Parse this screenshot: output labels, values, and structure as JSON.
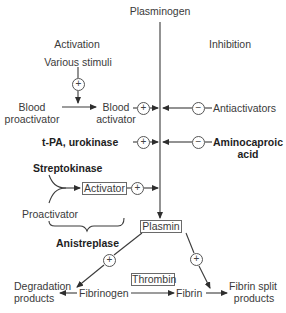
{
  "diagram": {
    "title_top": "Plasminogen",
    "section_headers": {
      "left": "Activation",
      "right": "Inhibition"
    },
    "activation": {
      "various_stimuli": "Various stimuli",
      "blood_proactivator_line1": "Blood",
      "blood_proactivator_line2": "proactivator",
      "blood_activator_line1": "Blood",
      "blood_activator_line2": "activator",
      "tpa_urokinase": "t-PA, urokinase",
      "streptokinase": "Streptokinase",
      "activator_box": "Activator",
      "proactivator": "Proactivator",
      "anistreplase": "Anistreplase"
    },
    "inhibition": {
      "antiactivators": "Antiactivators",
      "aminocaproic_line1": "Aminocaproic",
      "aminocaproic_line2": "acid"
    },
    "central": {
      "plasmin_box": "Plasmin",
      "thrombin_box": "Thrombin"
    },
    "products": {
      "degradation_line1": "Degradation",
      "degradation_line2": "products",
      "fibrinogen": "Fibrinogen",
      "fibrin": "Fibrin",
      "fibrin_split_line1": "Fibrin split",
      "fibrin_split_line2": "products"
    },
    "signs": {
      "plus": "+",
      "minus": "−"
    },
    "colors": {
      "line": "#3a3a3a",
      "text": "#3a3a3a",
      "box_border": "#6a6a6a"
    }
  }
}
